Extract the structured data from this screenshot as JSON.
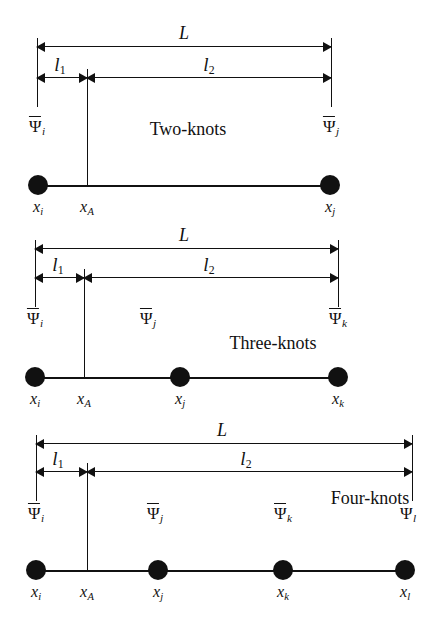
{
  "figure": {
    "type": "beam-knot-discretization-diagram",
    "panels": [
      {
        "id": "two-knots",
        "caption": "Two-knots",
        "caption_x": 188,
        "caption_y": 120,
        "origin_y": 25,
        "beam_y": 185,
        "left_tick_x": 37,
        "mid_tick_x": 87,
        "right_tick_x": 331,
        "dimensions": [
          {
            "name": "L",
            "label": "L",
            "sub": "",
            "label_x": 184,
            "y": 46,
            "from_x": 37,
            "to_x": 331
          },
          {
            "name": "l1",
            "label": "l",
            "sub": "1",
            "label_x": 60,
            "y": 77,
            "from_x": 37,
            "to_x": 87
          },
          {
            "name": "l2",
            "label": "l",
            "sub": "2",
            "label_x": 209,
            "y": 77,
            "from_x": 87,
            "to_x": 331
          }
        ],
        "psi_labels": [
          {
            "text": "Ψ",
            "sub": "i",
            "bar": true,
            "x": 37,
            "y": 118
          },
          {
            "text": "Ψ",
            "sub": "j",
            "bar": true,
            "x": 331,
            "y": 118
          }
        ],
        "nodes": [
          {
            "x": 38,
            "label": "x",
            "sub": "i",
            "label_y": 199
          },
          {
            "x": 330,
            "label": "x",
            "sub": "j",
            "label_y": 199
          }
        ],
        "beam_from_x": 38,
        "beam_to_x": 330,
        "xA": {
          "x": 87,
          "label": "x",
          "sub": "A",
          "label_y": 199,
          "tick_top": 77,
          "tick_bottom": 185
        }
      },
      {
        "id": "three-knots",
        "caption": "Three-knots",
        "caption_x": 273,
        "caption_y": 334,
        "origin_y": 215,
        "beam_y": 377,
        "left_tick_x": 35,
        "mid_tick_x": 84,
        "right_tick_x": 338,
        "dimensions": [
          {
            "name": "L",
            "label": "L",
            "sub": "",
            "label_x": 184,
            "y": 248,
            "from_x": 35,
            "to_x": 338
          },
          {
            "name": "l1",
            "label": "l",
            "sub": "1",
            "label_x": 58,
            "y": 277,
            "from_x": 35,
            "to_x": 84
          },
          {
            "name": "l2",
            "label": "l",
            "sub": "2",
            "label_x": 209,
            "y": 277,
            "from_x": 84,
            "to_x": 338
          }
        ],
        "psi_labels": [
          {
            "text": "Ψ",
            "sub": "i",
            "bar": true,
            "x": 35,
            "y": 310
          },
          {
            "text": "Ψ",
            "sub": "j",
            "bar": true,
            "x": 148,
            "y": 310
          },
          {
            "text": "Ψ",
            "sub": "k",
            "bar": true,
            "x": 338,
            "y": 310
          }
        ],
        "nodes": [
          {
            "x": 35,
            "label": "x",
            "sub": "i",
            "label_y": 391
          },
          {
            "x": 180,
            "label": "x",
            "sub": "j",
            "label_y": 391
          },
          {
            "x": 338,
            "label": "x",
            "sub": "k",
            "label_y": 391
          }
        ],
        "beam_from_x": 35,
        "beam_to_x": 338,
        "xA": {
          "x": 84,
          "label": "x",
          "sub": "A",
          "label_y": 391,
          "tick_top": 277,
          "tick_bottom": 377
        }
      },
      {
        "id": "four-knots",
        "caption": "Four-knots",
        "caption_x": 370,
        "caption_y": 489,
        "origin_y": 415,
        "beam_y": 570,
        "left_tick_x": 36,
        "mid_tick_x": 87,
        "right_tick_x": 412,
        "dimensions": [
          {
            "name": "L",
            "label": "L",
            "sub": "",
            "label_x": 222,
            "y": 443,
            "from_x": 36,
            "to_x": 412
          },
          {
            "name": "l1",
            "label": "l",
            "sub": "1",
            "label_x": 58,
            "y": 471,
            "from_x": 36,
            "to_x": 87
          },
          {
            "name": "l2",
            "label": "l",
            "sub": "2",
            "label_x": 246,
            "y": 471,
            "from_x": 87,
            "to_x": 412
          }
        ],
        "psi_labels": [
          {
            "text": "Ψ",
            "sub": "i",
            "bar": true,
            "x": 36,
            "y": 505
          },
          {
            "text": "Ψ",
            "sub": "j",
            "bar": true,
            "x": 155,
            "y": 505
          },
          {
            "text": "Ψ",
            "sub": "k",
            "bar": true,
            "x": 283,
            "y": 505
          },
          {
            "text": "Ψ",
            "sub": "l",
            "bar": false,
            "x": 408,
            "y": 505
          }
        ],
        "nodes": [
          {
            "x": 36,
            "label": "x",
            "sub": "i",
            "label_y": 584
          },
          {
            "x": 158,
            "label": "x",
            "sub": "j",
            "label_y": 584
          },
          {
            "x": 283,
            "label": "x",
            "sub": "k",
            "label_y": 584
          },
          {
            "x": 405,
            "label": "x",
            "sub": "l",
            "label_y": 584
          }
        ],
        "beam_from_x": 36,
        "beam_to_x": 405,
        "xA": {
          "x": 87,
          "label": "x",
          "sub": "A",
          "label_y": 584,
          "tick_top": 471,
          "tick_bottom": 570
        }
      }
    ],
    "colors": {
      "ink": "#111111",
      "background": "#ffffff"
    }
  }
}
